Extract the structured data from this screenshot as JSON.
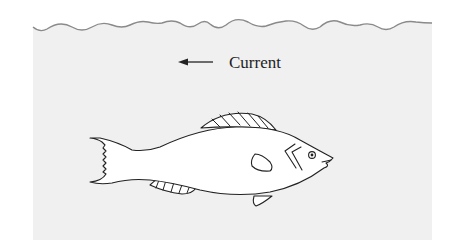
{
  "figure": {
    "type": "diagram",
    "labels": {
      "current": "Current"
    },
    "arrow": {
      "direction": "left",
      "meaning": "current direction"
    },
    "colors": {
      "water": "#f0f0f0",
      "surface_line": "#8a8a8a",
      "outline": "#222222",
      "fish_fill": "#ffffff",
      "background": "#ffffff"
    },
    "elements": [
      "water-surface",
      "current-arrow",
      "current-label",
      "fish"
    ]
  }
}
